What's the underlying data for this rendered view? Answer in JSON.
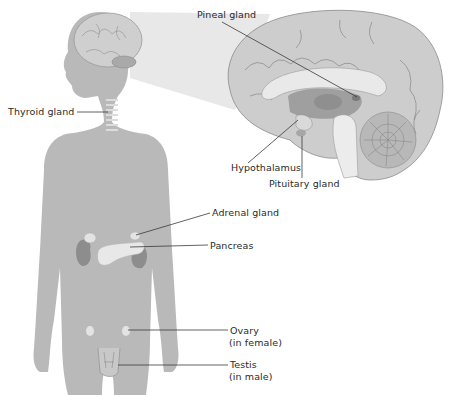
{
  "labels": {
    "pineal": "Pineal gland",
    "thyroid": "Thyroid gland",
    "hypothalamus": "Hypothalamus",
    "pituitary": "Pituitary gland",
    "adrenal": "Adrenal gland",
    "pancreas": "Pancreas",
    "ovary_line1": "Ovary",
    "ovary_line2": "(in female)",
    "testis_line1": "Testis",
    "testis_line2": "(in male)"
  },
  "colors": {
    "body": "#b9b9b9",
    "brain": "#cdcdcd",
    "brain_dark": "#9f9f9f",
    "callout": "#e2e2e2",
    "organ_light": "#e6e6e6",
    "kidney": "#8d8d8d",
    "leader": "#3a3a3a"
  }
}
